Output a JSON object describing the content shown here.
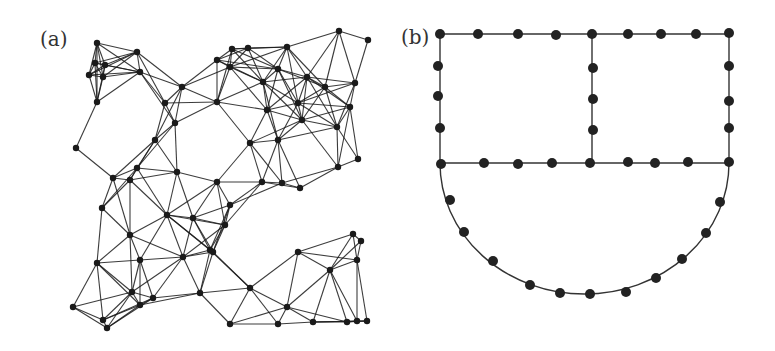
{
  "panels": {
    "a": {
      "label": "(a)",
      "description": "Random geometric graph of densely connected nodes in a square region with a hole",
      "edge_color": "#1a1a1a",
      "node_color": "#1a1a1a",
      "connect_radius": 62,
      "nodes": [
        [
          97,
          43
        ],
        [
          137,
          52
        ],
        [
          95,
          63
        ],
        [
          105,
          65
        ],
        [
          89,
          75
        ],
        [
          103,
          77
        ],
        [
          140,
          72
        ],
        [
          97,
          102
        ],
        [
          165,
          103
        ],
        [
          182,
          87
        ],
        [
          217,
          60
        ],
        [
          76,
          148
        ],
        [
          175,
          123
        ],
        [
          155,
          140
        ],
        [
          137,
          168
        ],
        [
          113,
          178
        ],
        [
          177,
          172
        ],
        [
          217,
          102
        ],
        [
          232,
          49
        ],
        [
          248,
          48
        ],
        [
          287,
          47
        ],
        [
          339,
          31
        ],
        [
          368,
          40
        ],
        [
          230,
          67
        ],
        [
          278,
          69
        ],
        [
          307,
          77
        ],
        [
          325,
          87
        ],
        [
          355,
          83
        ],
        [
          263,
          82
        ],
        [
          267,
          110
        ],
        [
          298,
          103
        ],
        [
          302,
          120
        ],
        [
          350,
          107
        ],
        [
          337,
          127
        ],
        [
          250,
          143
        ],
        [
          278,
          140
        ],
        [
          358,
          159
        ],
        [
          338,
          167
        ],
        [
          102,
          208
        ],
        [
          130,
          235
        ],
        [
          167,
          215
        ],
        [
          193,
          218
        ],
        [
          97,
          263
        ],
        [
          140,
          260
        ],
        [
          183,
          257
        ],
        [
          210,
          250
        ],
        [
          132,
          292
        ],
        [
          140,
          305
        ],
        [
          153,
          298
        ],
        [
          200,
          293
        ],
        [
          73,
          307
        ],
        [
          103,
          320
        ],
        [
          107,
          328
        ],
        [
          130,
          180
        ],
        [
          262,
          182
        ],
        [
          282,
          183
        ],
        [
          300,
          188
        ],
        [
          230,
          205
        ],
        [
          225,
          225
        ],
        [
          353,
          234
        ],
        [
          361,
          241
        ],
        [
          357,
          260
        ],
        [
          298,
          252
        ],
        [
          330,
          270
        ],
        [
          230,
          324
        ],
        [
          278,
          324
        ],
        [
          313,
          322
        ],
        [
          347,
          322
        ],
        [
          367,
          321
        ],
        [
          357,
          321
        ],
        [
          287,
          307
        ],
        [
          250,
          288
        ],
        [
          213,
          252
        ],
        [
          217,
          182
        ]
      ]
    },
    "b": {
      "label": "(b)",
      "description": "Two rectangles sharing a wall above a semicircular region, nodes along boundaries",
      "line_color": "#333333",
      "node_color": "#222222",
      "frame": {
        "left": 440,
        "right": 729,
        "top": 34,
        "middle_y": 163,
        "divider_x": 592,
        "arc_bottom": 294
      },
      "nodes": [
        [
          440,
          34
        ],
        [
          478,
          34
        ],
        [
          518,
          34
        ],
        [
          556,
          35
        ],
        [
          592,
          34
        ],
        [
          628,
          34
        ],
        [
          661,
          34
        ],
        [
          696,
          34
        ],
        [
          729,
          33
        ],
        [
          438,
          66
        ],
        [
          438,
          96
        ],
        [
          440,
          128
        ],
        [
          593,
          68
        ],
        [
          593,
          99
        ],
        [
          593,
          130
        ],
        [
          729,
          66
        ],
        [
          729,
          101
        ],
        [
          729,
          128
        ],
        [
          441,
          164
        ],
        [
          484,
          163
        ],
        [
          518,
          164
        ],
        [
          552,
          163
        ],
        [
          590,
          163
        ],
        [
          628,
          162
        ],
        [
          655,
          163
        ],
        [
          688,
          162
        ],
        [
          729,
          162
        ],
        [
          450,
          200
        ],
        [
          464,
          232
        ],
        [
          493,
          261
        ],
        [
          530,
          285
        ],
        [
          560,
          293
        ],
        [
          590,
          294
        ],
        [
          626,
          292
        ],
        [
          656,
          278
        ],
        [
          682,
          259
        ],
        [
          706,
          233
        ],
        [
          720,
          202
        ]
      ]
    }
  }
}
